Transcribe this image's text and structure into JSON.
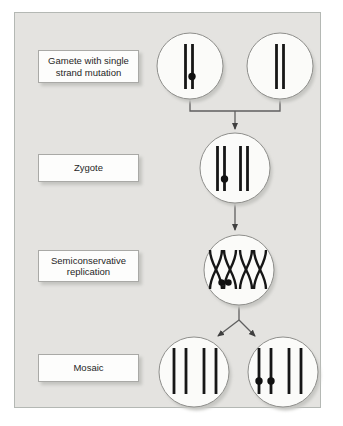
{
  "stage_labels": {
    "gamete": [
      "Gamete with single",
      "strand mutation"
    ],
    "zygote": [
      "Zygote"
    ],
    "replication": [
      "Semiconservative",
      "replication"
    ],
    "mosaic": [
      "Mosaic"
    ]
  },
  "stages": [
    {
      "label": "Gamete with single strand mutation",
      "cells": [
        "gamete: 2 strands, mutation dot on right strand",
        "gamete: 2 plain strands"
      ]
    },
    {
      "label": "Zygote",
      "cells": [
        "zygote: 2 chromosome pairs, mutation dot on second strand of left pair"
      ]
    },
    {
      "label": "Semiconservative replication",
      "cells": [
        "cell: two X-shaped replicating chromosomes, two mutation dots at bottom of left structure"
      ]
    },
    {
      "label": "Mosaic",
      "cells": [
        "daughter cell: 2 plain chromosome pairs",
        "daughter cell: mutation dots on both strands of left pair"
      ]
    }
  ],
  "colors": {
    "page_bg": "#ffffff",
    "panel_bg": "#e4e3e0",
    "panel_border": "#b4b8b4",
    "label_box_bg": "#fdfdfc",
    "label_box_border": "#a9a9a6",
    "cell_fill": "#fbfbf9",
    "cell_border": "#8f8f8c",
    "strand": "#161616",
    "connector": "#5f5f5f",
    "shadow": "#c6c6c2"
  }
}
